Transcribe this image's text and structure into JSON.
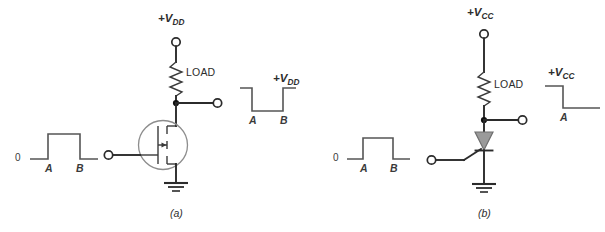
{
  "figure": {
    "background_color": "#ffffff",
    "wire_color": "#2b2b2b",
    "waveform_color": "#555555",
    "scr_fill_color": "#9a9a9a",
    "fet_circle_color": "#8d8d8d",
    "width": 605,
    "height": 232
  },
  "panel_a": {
    "caption": "(a)",
    "supply_label": "+V",
    "supply_subscript": "DD",
    "load_label": "LOAD",
    "device": "n-channel-mosfet",
    "input_waveform": {
      "zero_label": "0",
      "mark_a": "A",
      "mark_b": "B",
      "shape": "low-high-low",
      "description": "Input pulse: starts at 0, rises at A, falls back to 0 at B"
    },
    "output_waveform": {
      "supply_label": "+V",
      "supply_subscript": "DD",
      "mark_a": "A",
      "mark_b": "B",
      "shape": "high-low-high",
      "description": "Inverted output: starts at +VDD, drops low at A, returns to +VDD at B"
    }
  },
  "panel_b": {
    "caption": "(b)",
    "supply_label": "+V",
    "supply_subscript": "CC",
    "load_label": "LOAD",
    "device": "scr-thyristor",
    "input_waveform": {
      "zero_label": "0",
      "mark_a": "A",
      "mark_b": "B",
      "shape": "low-high-low",
      "description": "Input pulse: starts at 0, rises at A, falls back to 0 at B"
    },
    "output_waveform": {
      "supply_label": "+V",
      "supply_subscript": "CC",
      "mark_a": "A",
      "shape": "high-low-latched",
      "description": "Latching output: starts at +VCC, drops low at A and stays low"
    }
  }
}
